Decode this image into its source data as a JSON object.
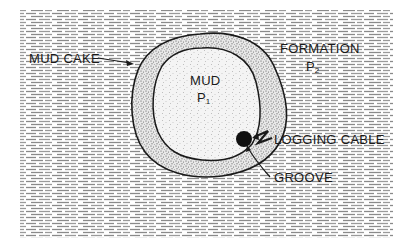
{
  "diagram": {
    "type": "cross-section",
    "regions": [
      {
        "id": "formation",
        "label": "FORMATION",
        "pressure_label": "P",
        "pressure_subscript": "2",
        "pattern": "horizontal-dash-hatch"
      },
      {
        "id": "mud_cake",
        "label": "MUD CAKE",
        "pattern": "dense-stipple"
      },
      {
        "id": "mud",
        "label": "MUD",
        "pressure_label": "P",
        "pressure_subscript": "1",
        "pattern": "light-stipple"
      }
    ],
    "labels": {
      "mud_cake": "MUD CAKE",
      "mud": "MUD",
      "mud_pressure": "P",
      "mud_pressure_sub": "1",
      "formation": "FORMATION",
      "formation_pressure": "P",
      "formation_pressure_sub": "2",
      "logging_cable": "LOGGING CABLE",
      "groove": "GROOVE"
    },
    "colors": {
      "ink": "#1a1a1a",
      "hatch": "#8a8a8a",
      "background": "#ffffff"
    }
  }
}
